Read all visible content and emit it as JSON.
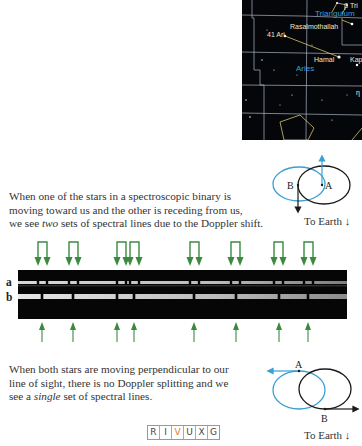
{
  "star_map": {
    "labels": {
      "beta_tri": "β Tri",
      "triangulum": "Triangulum",
      "rasalmothallah": "Rasalmothallah",
      "ari_41": "41 Ari",
      "hamal": "Hamal",
      "kap": "Kap",
      "aries": "Aries",
      "eta": "η"
    },
    "colors": {
      "background": "#05060a",
      "grid": "#c9d6e6",
      "constellation_name": "#3aa0d8",
      "star_label": "#f2e7c8",
      "figure_line": "#d6c56a"
    }
  },
  "top_panel": {
    "caption_lines": [
      "When one of the stars in a spectroscopic binary is",
      "moving toward us and the other is receding from us,"
    ],
    "caption_line3_pre": "we see ",
    "caption_line3_em": "two",
    "caption_line3_post": " sets of spectral lines due to the Doppler shift.",
    "diagram": {
      "star_a": "A",
      "star_b": "B",
      "earth_label": "To Earth"
    }
  },
  "spectrum": {
    "row_labels": {
      "a": "a",
      "b": "b"
    },
    "split_arrow_pairs_x": [
      [
        38,
        47
      ],
      [
        69,
        78
      ],
      [
        117,
        126
      ],
      [
        130,
        139
      ],
      [
        190,
        199
      ],
      [
        231,
        240
      ],
      [
        274,
        283
      ],
      [
        304,
        313
      ]
    ],
    "single_arrow_x": [
      42,
      73,
      117,
      134,
      194,
      236,
      279,
      308
    ],
    "arrow_color": "#3b8a3f"
  },
  "bottom_panel": {
    "caption_lines": [
      "When both stars are moving perpendicular to our",
      "line of sight, there is no Doppler splitting and we"
    ],
    "caption_line3_pre": "see a ",
    "caption_line3_em": "single",
    "caption_line3_post": " set of spectral lines.",
    "diagram": {
      "star_a": "A",
      "star_b": "B",
      "earth_label": "To Earth"
    }
  },
  "wavelength_badge": {
    "letters": [
      "R",
      "I",
      "V",
      "U",
      "X",
      "G"
    ],
    "active": "V",
    "active_color": "#e07a1f"
  },
  "colors": {
    "blue_orbit": "#3a9fd1",
    "black_orbit": "#1a1a1a"
  }
}
